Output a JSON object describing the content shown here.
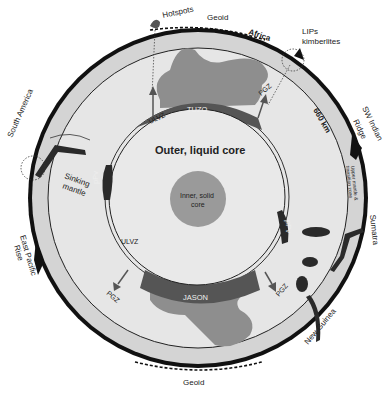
{
  "diagram": {
    "type": "earth-cross-section",
    "colors": {
      "background": "#ffffff",
      "crust_outline": "#111111",
      "upper_mantle": "#d4d4d4",
      "lower_mantle": "#e6e6e6",
      "outer_core": "#e9e9e9",
      "inner_core": "#9a9a9a",
      "llsvp_light": "#8e8e8e",
      "llsvp_dark": "#555555",
      "slab": "#2a2a2a"
    },
    "labels": {
      "hotspots": "Hotspots",
      "geoid_top": "Geoid",
      "geoid_bottom": "Geoid",
      "africa": "Africa",
      "lips_line1": "LIPs",
      "lips_line2": "kimberlites",
      "sw_indian_line1": "SW Indian",
      "sw_indian_line2": "Ridge",
      "km660": "660 km",
      "transition_line1": "Upper mantle &",
      "transition_line2": "transition zone",
      "sumatra": "Sumatra",
      "new_guinea": "New Guinea",
      "south_america": "South America",
      "east_pacific_line1": "East Pacific",
      "east_pacific_line2": "Rise",
      "sinking_line1": "Sinking",
      "sinking_line2": "mantle",
      "tuzo": "TUZO",
      "jason": "JASON",
      "outer_core": "Outer, liquid core",
      "inner_core_line1": "Inner, solid",
      "inner_core_line2": "core",
      "ulvz_top": "ULVZ",
      "ulvz_bottom": "ULVZ",
      "pgz_top_right": "PGZ",
      "pgz_bottom_left": "PGZ",
      "pgz_bottom_right": "PGZ",
      "dpp_left": "pPv",
      "dpp_right": "pPv"
    }
  }
}
